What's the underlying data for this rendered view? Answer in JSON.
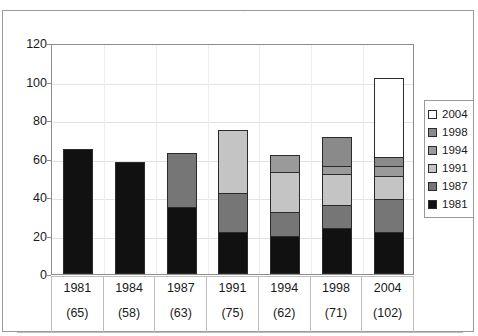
{
  "chart_data": {
    "type": "bar",
    "subtype": "stacked-bar",
    "title": "",
    "title_remnant": "·",
    "xlabel": "",
    "ylabel": "",
    "ylim": [
      0,
      120
    ],
    "yticks": [
      0,
      20,
      40,
      60,
      80,
      100,
      120
    ],
    "ytick_labels": [
      "0",
      "20",
      "40",
      "60",
      "80",
      "100",
      "120"
    ],
    "grid": true,
    "grid_axis": "y",
    "legend_position": "right",
    "categories": [
      "1981",
      "1984",
      "1987",
      "1991",
      "1994",
      "1998",
      "2004"
    ],
    "category_sublabels": [
      "(65)",
      "(58)",
      "(63)",
      "(75)",
      "(62)",
      "(71)",
      "(102)"
    ],
    "category_totals": [
      65,
      58,
      63,
      75,
      62,
      71,
      102
    ],
    "series": [
      {
        "name": "1981",
        "color": "#111111",
        "values": [
          65,
          58,
          35,
          22,
          20,
          24,
          22
        ]
      },
      {
        "name": "1987",
        "color": "#767676",
        "values": [
          0,
          0,
          28,
          20,
          12,
          12,
          17
        ]
      },
      {
        "name": "1991",
        "color": "#c4c4c4",
        "values": [
          0,
          0,
          0,
          33,
          21,
          16,
          12
        ]
      },
      {
        "name": "1994",
        "color": "#9a9a9a",
        "values": [
          0,
          0,
          0,
          0,
          9,
          4,
          5
        ]
      },
      {
        "name": "1998",
        "color": "#8a8a8a",
        "values": [
          0,
          0,
          0,
          0,
          0,
          15,
          5
        ]
      },
      {
        "name": "2004",
        "color": "#ffffff",
        "values": [
          0,
          0,
          0,
          0,
          0,
          0,
          41
        ]
      }
    ],
    "legend_entries": [
      {
        "label": "2004",
        "color": "#ffffff"
      },
      {
        "label": "1998",
        "color": "#8a8a8a"
      },
      {
        "label": "1994",
        "color": "#9a9a9a"
      },
      {
        "label": "1991",
        "color": "#c4c4c4"
      },
      {
        "label": "1987",
        "color": "#767676"
      },
      {
        "label": "1981",
        "color": "#111111"
      }
    ]
  },
  "colors": {
    "frame": "#9a9a9a",
    "axis": "#8c8c8c",
    "grid": "#e3e3e3",
    "text": "#1a1a1a",
    "bar_outline": "#2b2b2b",
    "background": "#ffffff"
  }
}
